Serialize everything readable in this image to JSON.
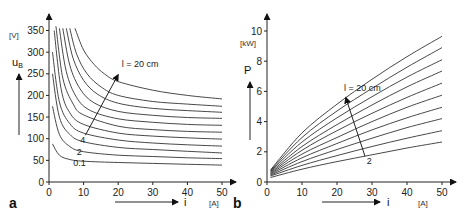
{
  "chart_data": [
    {
      "panel": "a",
      "type": "line",
      "title": "",
      "xlabel": "i",
      "xunit": "[A]",
      "ylabel": "u_B",
      "yunit": "[V]",
      "xlim": [
        0,
        50
      ],
      "ylim": [
        0,
        375
      ],
      "xticks": [
        0,
        10,
        20,
        30,
        40,
        50
      ],
      "yticks": [
        0,
        50,
        100,
        150,
        200,
        250,
        300,
        350
      ],
      "grid": false,
      "annotations": [
        {
          "text": "l = 20 cm",
          "x": 21,
          "y": 265
        },
        {
          "text": "4",
          "x": 9,
          "y": 90
        },
        {
          "text": "2",
          "x": 8,
          "y": 63
        },
        {
          "text": "0.1",
          "x": 7,
          "y": 38
        }
      ],
      "arrow": {
        "from": [
          10.5,
          108
        ],
        "to": [
          20,
          248
        ],
        "meaning": "increasing arc length l"
      },
      "series": [
        {
          "name": "l = 0.1 cm",
          "x": [
            1,
            3,
            6,
            10,
            20,
            30,
            40,
            50
          ],
          "y": [
            88,
            62,
            52,
            48,
            45,
            43,
            41,
            39
          ]
        },
        {
          "name": "l = 2 cm",
          "x": [
            1,
            3,
            6,
            10,
            20,
            30,
            40,
            50
          ],
          "y": [
            175,
            110,
            82,
            70,
            62,
            59,
            56,
            54
          ]
        },
        {
          "name": "l = 4 cm",
          "x": [
            1,
            3,
            6,
            10,
            20,
            30,
            40,
            50
          ],
          "y": [
            250,
            150,
            110,
            93,
            80,
            75,
            71,
            67
          ]
        },
        {
          "name": "l = 6 cm",
          "x": [
            1,
            3,
            6,
            10,
            20,
            30,
            40,
            50
          ],
          "y": [
            300,
            185,
            135,
            113,
            97,
            90,
            86,
            83
          ]
        },
        {
          "name": "l = 8 cm",
          "x": [
            1.5,
            3.5,
            6,
            10,
            20,
            30,
            40,
            50
          ],
          "y": [
            350,
            215,
            160,
            133,
            113,
            106,
            102,
            99
          ]
        },
        {
          "name": "l = 10 cm",
          "x": [
            2,
            4,
            7,
            10,
            20,
            30,
            40,
            50
          ],
          "y": [
            360,
            240,
            180,
            155,
            129,
            121,
            117,
            115
          ]
        },
        {
          "name": "l = 12 cm",
          "x": [
            3,
            5,
            8,
            12,
            20,
            30,
            40,
            50
          ],
          "y": [
            355,
            255,
            195,
            165,
            146,
            138,
            133,
            131
          ]
        },
        {
          "name": "l = 14 cm",
          "x": [
            4,
            6,
            9,
            13,
            20,
            30,
            40,
            50
          ],
          "y": [
            355,
            270,
            215,
            183,
            163,
            154,
            149,
            147
          ]
        },
        {
          "name": "l = 16 cm",
          "x": [
            5,
            7,
            10,
            14,
            20,
            30,
            40,
            50
          ],
          "y": [
            355,
            285,
            235,
            203,
            182,
            170,
            165,
            161
          ]
        },
        {
          "name": "l = 18 cm",
          "x": [
            6,
            8,
            11,
            15,
            20,
            30,
            40,
            50
          ],
          "y": [
            355,
            295,
            250,
            220,
            200,
            186,
            180,
            175
          ]
        },
        {
          "name": "l = 20 cm",
          "x": [
            7.5,
            10,
            13,
            16,
            20,
            30,
            40,
            50
          ],
          "y": [
            355,
            305,
            272,
            250,
            232,
            212,
            200,
            192
          ]
        }
      ]
    },
    {
      "panel": "b",
      "type": "line",
      "title": "",
      "xlabel": "i",
      "xunit": "[A]",
      "ylabel": "P",
      "yunit": "[kW]",
      "xlim": [
        0,
        50
      ],
      "ylim": [
        0,
        11
      ],
      "xticks": [
        0,
        10,
        20,
        30,
        40,
        50
      ],
      "yticks": [
        0,
        2,
        4,
        6,
        8,
        10
      ],
      "grid": false,
      "annotations": [
        {
          "text": "l = 20 cm",
          "x": 22,
          "y": 6.0
        },
        {
          "text": "2",
          "x": 28.5,
          "y": 1.2
        }
      ],
      "arrow": {
        "from": [
          28,
          1.7
        ],
        "to": [
          22.5,
          5.6
        ],
        "meaning": "increasing arc length l"
      },
      "series": [
        {
          "name": "l = 2 cm",
          "x": [
            1,
            10,
            20,
            30,
            40,
            50
          ],
          "y": [
            0.3,
            0.85,
            1.35,
            1.8,
            2.25,
            2.65
          ]
        },
        {
          "name": "l = 4 cm",
          "x": [
            1,
            10,
            20,
            30,
            40,
            50
          ],
          "y": [
            0.4,
            1.1,
            1.75,
            2.35,
            2.9,
            3.4
          ]
        },
        {
          "name": "l = 6 cm",
          "x": [
            1,
            10,
            20,
            30,
            40,
            50
          ],
          "y": [
            0.45,
            1.35,
            2.15,
            2.9,
            3.6,
            4.2
          ]
        },
        {
          "name": "l = 8 cm",
          "x": [
            1,
            10,
            20,
            30,
            40,
            50
          ],
          "y": [
            0.5,
            1.6,
            2.55,
            3.45,
            4.25,
            4.95
          ]
        },
        {
          "name": "l = 10 cm",
          "x": [
            1,
            10,
            20,
            30,
            40,
            50
          ],
          "y": [
            0.55,
            1.85,
            2.95,
            4.0,
            4.95,
            5.75
          ]
        },
        {
          "name": "l = 12 cm",
          "x": [
            1,
            10,
            20,
            30,
            40,
            50
          ],
          "y": [
            0.6,
            2.1,
            3.4,
            4.55,
            5.6,
            6.55
          ]
        },
        {
          "name": "l = 14 cm",
          "x": [
            1,
            10,
            20,
            30,
            40,
            50
          ],
          "y": [
            0.65,
            2.35,
            3.8,
            5.1,
            6.3,
            7.35
          ]
        },
        {
          "name": "l = 16 cm",
          "x": [
            1,
            10,
            20,
            30,
            40,
            50
          ],
          "y": [
            0.7,
            2.65,
            4.25,
            5.65,
            6.95,
            8.1
          ]
        },
        {
          "name": "l = 18 cm",
          "x": [
            1,
            10,
            20,
            30,
            40,
            50
          ],
          "y": [
            0.75,
            2.95,
            4.7,
            6.2,
            7.6,
            8.9
          ]
        },
        {
          "name": "l = 20 cm",
          "x": [
            1,
            10,
            20,
            30,
            40,
            50
          ],
          "y": [
            0.8,
            3.25,
            5.15,
            6.8,
            8.3,
            9.65
          ]
        }
      ]
    }
  ]
}
